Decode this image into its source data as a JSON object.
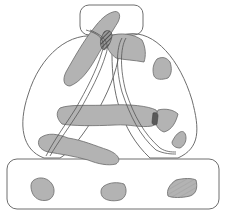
{
  "diagram": {
    "colors": {
      "background": "#ffffff",
      "region_outline": "#6e6e6e",
      "blob_fill": "#b3b3b3",
      "blob_outline": "#6a6a6a",
      "band_line": "#555555",
      "hatch_dark": "#5a5a5a"
    },
    "regions": [
      {
        "id": "top-box",
        "shape": "rounded-rect"
      },
      {
        "id": "left-oval",
        "shape": "oval"
      },
      {
        "id": "right-oval",
        "shape": "oval"
      },
      {
        "id": "bottom-box",
        "shape": "rounded-rect"
      }
    ],
    "blob_count": 12,
    "hatched_overlaps": 2,
    "bands": 2
  }
}
